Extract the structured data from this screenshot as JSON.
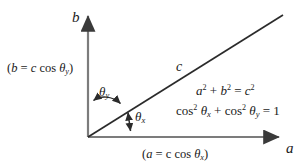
{
  "figure": {
    "kind": "vector-components-diagram",
    "background_color": "#ffffff",
    "axis_color": "#7c7c7c",
    "line_color": "#2b2b2b",
    "text_color": "#1a1a1a"
  },
  "axes": {
    "y_axis_label": "b",
    "x_axis_label": "a",
    "origin": {
      "x": 88,
      "y": 137
    },
    "y_axis_tip": {
      "x": 88,
      "y": 12
    },
    "x_axis_tip": {
      "x": 283,
      "y": 137
    }
  },
  "hypotenuse": {
    "label": "c",
    "start": {
      "x": 88,
      "y": 137
    },
    "end": {
      "x": 283,
      "y": 15
    }
  },
  "angles": {
    "theta_y": {
      "symbol": "θ",
      "subscript": "y",
      "between": "y-axis and vector",
      "arrow": "double-headed-curved"
    },
    "theta_x": {
      "symbol": "θ",
      "subscript": "x",
      "between": "x-axis and vector",
      "arrow": "double-headed-vertical"
    }
  },
  "component_labels": {
    "y_component": {
      "open_paren": "(",
      "var": "b",
      "equals": " = ",
      "magnitude": "c",
      "func": " cos ",
      "theta": "θ",
      "sub": "y",
      "close_paren": ")"
    },
    "x_component": {
      "open_paren": "(",
      "var": "a",
      "equals": " = ",
      "magnitude": "c",
      "func": " cos ",
      "theta": "θ",
      "sub": "x",
      "close_paren": ")"
    }
  },
  "equations": {
    "pythagorean": {
      "a": "a",
      "exp_a": "2",
      "plus": " + ",
      "b": "b",
      "exp_b": "2",
      "equals": " = ",
      "c": "c",
      "exp_c": "2"
    },
    "cosine_identity": {
      "cos1": "cos",
      "exp1": "2",
      "theta1": "θ",
      "sub1": "x",
      "plus": " + ",
      "cos2": "cos",
      "exp2": "2",
      "theta2": "θ",
      "sub2": "y",
      "equals": " = ",
      "result": "1"
    }
  }
}
